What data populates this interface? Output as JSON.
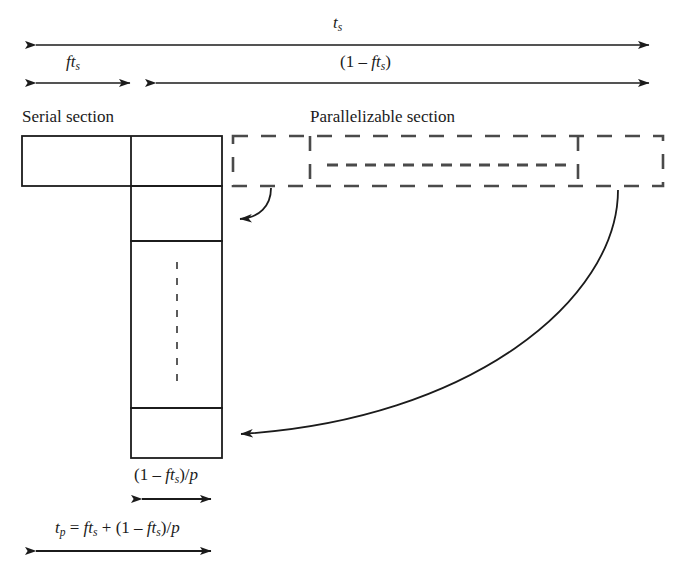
{
  "figure": {
    "type": "diagram",
    "background_color": "#ffffff",
    "line_color": "#1b1b1b"
  },
  "labels": {
    "total_time": {
      "base": "t",
      "sub": "s",
      "text": "t_s"
    },
    "serial_fraction": {
      "text": "ft_s",
      "parts": [
        "f",
        "t",
        "s"
      ]
    },
    "parallel_fraction": {
      "text": "(1 - ft_s)",
      "open": "(1 – ",
      "base": "ft",
      "sub": "s",
      "close": ")"
    },
    "serial_section": "Serial section",
    "parallelizable_section": "Parallelizable section",
    "parallel_over_p": {
      "text": "(1 - ft_s)/p",
      "open": "(1 – ",
      "base": "ft",
      "sub": "s",
      "close": ")/",
      "divisor": "p"
    },
    "total_parallel_time": {
      "text": "t_p = ft_s + (1 - ft_s)/p",
      "lhs_base": "t",
      "lhs_sub": "p",
      "eq": " = ",
      "term1_base": "ft",
      "term1_sub": "s",
      "plus": " + ",
      "term2_open": "(1 – ",
      "term2_base": "ft",
      "term2_sub": "s",
      "term2_close": ")/",
      "term2_divisor": "p"
    }
  },
  "geometry": {
    "arrows": {
      "total_time_bar": {
        "x1": 25,
        "x2": 660,
        "y": 45,
        "heads": "both"
      },
      "serial_fraction_bar": {
        "x1": 25,
        "x2": 140,
        "y": 83,
        "heads": "both"
      },
      "parallel_fraction_bar": {
        "x1": 146,
        "x2": 660,
        "y": 83,
        "heads": "both"
      },
      "parallel_over_p_bar": {
        "x1": 131,
        "x2": 222,
        "y": 499,
        "heads": "both"
      },
      "total_parallel_bar": {
        "x1": 25,
        "x2": 222,
        "y": 551,
        "heads": "both"
      }
    },
    "solid_boxes": {
      "serial_row": {
        "x": 22,
        "y": 136,
        "w": 200,
        "h": 50,
        "divider_x": 131
      },
      "column_cells": [
        {
          "x": 131,
          "y": 186,
          "w": 91,
          "h": 55
        },
        {
          "x": 131,
          "y": 241,
          "w": 91,
          "h": 167,
          "dashed_vertical": true
        },
        {
          "x": 131,
          "y": 408,
          "w": 91,
          "h": 50
        }
      ]
    },
    "dashed_region": {
      "x": 233,
      "y": 136,
      "w": 430,
      "h": 50,
      "divider_x1": 310,
      "divider_x2": 578
    },
    "inner_dashed_bar": {
      "x1": 327,
      "x2": 570,
      "y": 165
    },
    "curved_arrows": [
      {
        "name": "short-callout",
        "from_x": 271,
        "from_y": 188,
        "to_x": 228,
        "to_y": 219
      },
      {
        "name": "long-callout",
        "from_x": 618,
        "from_y": 190,
        "to_x": 228,
        "to_y": 434
      }
    ]
  }
}
